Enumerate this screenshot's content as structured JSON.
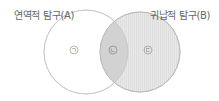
{
  "diagram": {
    "type": "venn",
    "sets": [
      {
        "id": "A",
        "label": "연역적 탐구(A)",
        "fill": "#ffffff",
        "stroke": "#c8c8c8"
      },
      {
        "id": "B",
        "label": "귀납적 탐구(B)",
        "fill": "#e6e6e6",
        "stroke": "#bdbdbd"
      }
    ],
    "regions": [
      {
        "marker": "ㄱ",
        "region": "A only"
      },
      {
        "marker": "ㄴ",
        "region": "A ∩ B",
        "fill": "#cfcfcf"
      },
      {
        "marker": "ㄷ",
        "region": "B only"
      }
    ]
  }
}
